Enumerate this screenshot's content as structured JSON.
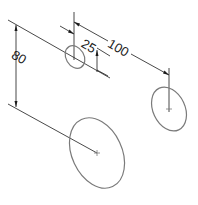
{
  "drawing": {
    "type": "isometric hole pattern dimension sketch",
    "dimensions": [
      {
        "id": "dim-vertical",
        "label": "80"
      },
      {
        "id": "dim-offset",
        "label": "25"
      },
      {
        "id": "dim-spacing",
        "label": "100"
      }
    ],
    "holes": [
      {
        "id": "small-hole",
        "size": "small"
      },
      {
        "id": "right-hole",
        "size": "medium"
      },
      {
        "id": "bottom-hole",
        "size": "large"
      }
    ],
    "colors": {
      "line": "#1a1a1a",
      "ellipse": "#7a7a7a",
      "background": "#ffffff"
    }
  }
}
